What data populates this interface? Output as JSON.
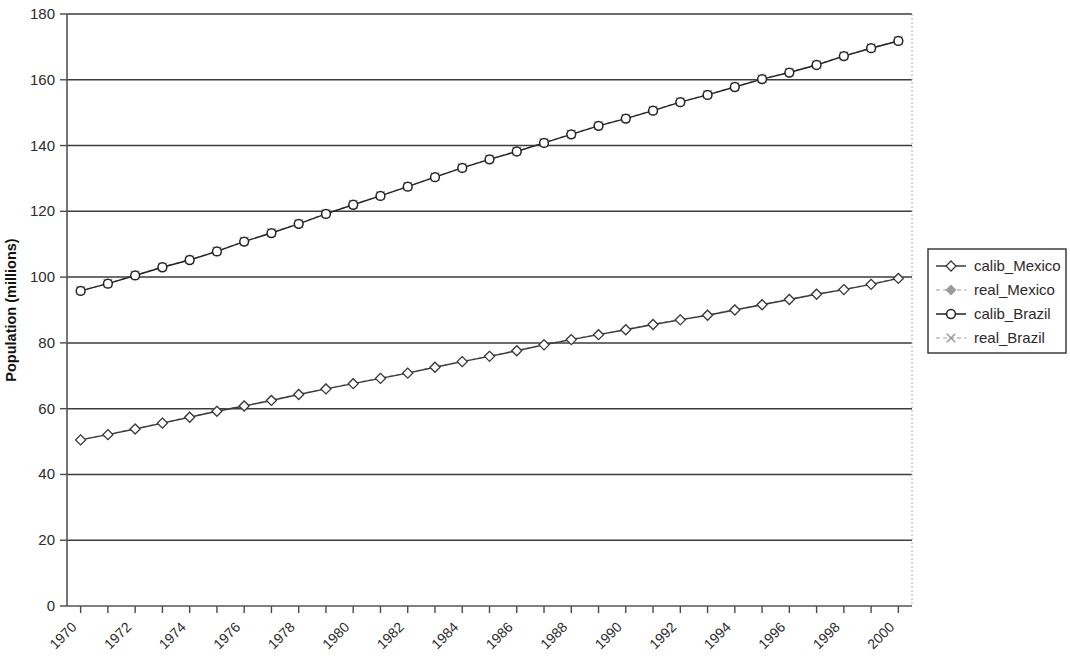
{
  "chart_data": {
    "type": "line",
    "title": "",
    "xlabel": "",
    "ylabel": "Population (millions)",
    "ylim": [
      0,
      180
    ],
    "ytick_values": [
      0,
      20,
      40,
      60,
      80,
      100,
      120,
      140,
      160,
      180
    ],
    "ytick_labels": [
      "0",
      "20",
      "40",
      "60",
      "80",
      "100",
      "120",
      "140",
      "160",
      "180"
    ],
    "xlim": [
      1970,
      2001
    ],
    "x": [
      1970,
      1971,
      1972,
      1973,
      1974,
      1975,
      1976,
      1977,
      1978,
      1979,
      1980,
      1981,
      1982,
      1983,
      1984,
      1985,
      1986,
      1987,
      1988,
      1989,
      1990,
      1991,
      1992,
      1993,
      1994,
      1995,
      1996,
      1997,
      1998,
      1999,
      2000
    ],
    "xtick_labels": [
      "1970",
      "1972",
      "1974",
      "1976",
      "1978",
      "1980",
      "1982",
      "1984",
      "1986",
      "1988",
      "1990",
      "1992",
      "1994",
      "1996",
      "1998",
      "2000"
    ],
    "xtick_label_rotation": -45,
    "grid": "horizontal",
    "legend_position": "right",
    "series": [
      {
        "name": "calib_Mexico",
        "marker": "open-diamond",
        "color": "#3a3a3a",
        "line_style": "solid",
        "values": [
          50.5,
          52.1,
          53.8,
          55.6,
          57.4,
          59.2,
          60.8,
          62.5,
          64.3,
          66.0,
          67.6,
          69.2,
          70.8,
          72.6,
          74.3,
          75.9,
          77.6,
          79.4,
          81.0,
          82.5,
          84.0,
          85.6,
          87.0,
          88.4,
          90.0,
          91.6,
          93.2,
          94.8,
          96.2,
          97.8,
          99.6
        ]
      },
      {
        "name": "real_Mexico",
        "marker": "filled-square",
        "color": "#9b9b9b",
        "line_style": "dashed",
        "values": [
          50.6,
          52.2,
          53.9,
          55.7,
          57.5,
          59.3,
          60.9,
          62.6,
          64.4,
          66.1,
          67.7,
          69.3,
          70.9,
          72.7,
          74.4,
          76.0,
          77.7,
          79.5,
          81.1,
          82.6,
          84.1,
          85.7,
          87.1,
          88.5,
          90.1,
          91.7,
          93.3,
          94.9,
          96.3,
          97.9,
          99.7
        ]
      },
      {
        "name": "calib_Brazil",
        "marker": "open-circle",
        "color": "#222222",
        "line_style": "solid",
        "values": [
          95.8,
          98.0,
          100.5,
          103.0,
          105.2,
          107.8,
          110.8,
          113.4,
          116.2,
          119.2,
          122.0,
          124.7,
          127.5,
          130.4,
          133.2,
          135.8,
          138.2,
          140.8,
          143.4,
          146.0,
          148.2,
          150.6,
          153.2,
          155.4,
          157.8,
          160.2,
          162.2,
          164.5,
          167.2,
          169.6,
          171.8
        ]
      },
      {
        "name": "real_Brazil",
        "marker": "cross-x",
        "color": "#9b9b9b",
        "line_style": "dashed",
        "values": [
          95.9,
          98.1,
          100.6,
          103.1,
          105.3,
          107.9,
          110.9,
          113.5,
          116.3,
          119.3,
          122.1,
          124.8,
          127.6,
          130.5,
          133.3,
          135.9,
          138.3,
          140.9,
          143.5,
          146.1,
          148.3,
          150.7,
          153.3,
          155.5,
          157.9,
          160.3,
          162.3,
          164.6,
          167.3,
          169.7,
          171.9
        ]
      }
    ]
  },
  "legend": {
    "entries": [
      {
        "label": "calib_Mexico"
      },
      {
        "label": "real_Mexico"
      },
      {
        "label": "calib_Brazil"
      },
      {
        "label": "real_Brazil"
      }
    ]
  }
}
